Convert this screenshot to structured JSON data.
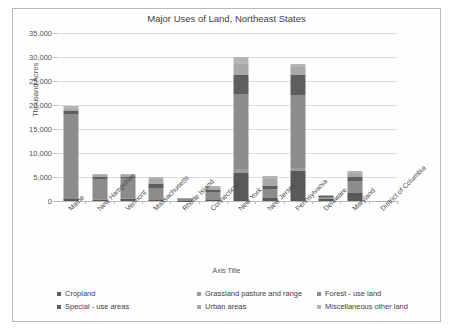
{
  "chart_data": {
    "type": "bar",
    "stacked": true,
    "title": "Major Uses of Land, Northeast States",
    "xlabel": "Axis Title",
    "ylabel": "Thousand Acres",
    "ylim": [
      0,
      35000
    ],
    "ytick_values": [
      0,
      5000,
      10000,
      15000,
      20000,
      25000,
      30000,
      35000
    ],
    "ytick_labels": [
      "0",
      "5,000",
      "10,000",
      "15,000",
      "20,000",
      "25,000",
      "30,000",
      "35,000"
    ],
    "grid": true,
    "legend_position": "bottom",
    "categories": [
      "Maine",
      "New Hampshire",
      "Vermont",
      "Massachusetts",
      "Rhode Island",
      "Connecticut",
      "New York",
      "New Jersey",
      "Pennsylvania",
      "Delaware",
      "Maryland",
      "District of Columbia"
    ],
    "series": [
      {
        "name": "Cropland",
        "color": "#595959",
        "values": [
          400,
          300,
          450,
          250,
          50,
          200,
          5800,
          600,
          6200,
          500,
          1600,
          0
        ]
      },
      {
        "name": "Grassland pasture and range",
        "color": "#9b9b9b",
        "values": [
          50,
          60,
          150,
          60,
          10,
          40,
          800,
          100,
          700,
          30,
          120,
          0
        ]
      },
      {
        "name": "Forest - use land",
        "color": "#8c8c8c",
        "values": [
          17700,
          4300,
          4100,
          2500,
          360,
          1700,
          15800,
          1800,
          15200,
          330,
          2400,
          1
        ]
      },
      {
        "name": "Special - use areas",
        "color": "#5e5e5e",
        "values": [
          600,
          350,
          400,
          650,
          60,
          300,
          3900,
          700,
          4200,
          120,
          900,
          3
        ]
      },
      {
        "name": "Urban areas",
        "color": "#a8a8a8",
        "values": [
          500,
          350,
          250,
          1100,
          130,
          560,
          2200,
          1300,
          1700,
          150,
          800,
          30
        ]
      },
      {
        "name": "Miscellaneous other land",
        "color": "#b5b5b5",
        "values": [
          450,
          240,
          250,
          440,
          90,
          300,
          1600,
          700,
          600,
          70,
          380,
          5
        ]
      }
    ],
    "totals": [
      19700,
      5600,
      5600,
      5000,
      700,
      3100,
      30100,
      5200,
      28600,
      1200,
      6200,
      39
    ]
  }
}
